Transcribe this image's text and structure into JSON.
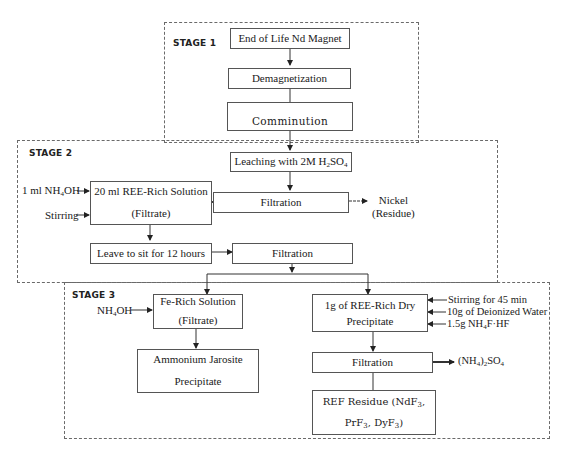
{
  "stages": [
    {
      "id": "stage1",
      "label": "STAGE 1"
    },
    {
      "id": "stage2",
      "label": "STAGE 2"
    },
    {
      "id": "stage3",
      "label": "STAGE 3"
    }
  ],
  "boxes": {
    "end_of_life": "End of Life Nd Magnet",
    "demagnetization": "Demagnetization",
    "comminution": "Comminution",
    "leaching_prefix": "Leaching with 2M H",
    "leaching_sub1": "2",
    "leaching_mid": "SO",
    "leaching_sub2": "4",
    "filtration1": "Filtration",
    "ree_solution_line1": "20 ml REE-Rich Solution",
    "ree_solution_line2": "(Filtrate)",
    "leave_to_sit": "Leave to sit for 12 hours",
    "filtration2": "Filtration",
    "fe_solution_line1": "Fe-Rich Solution",
    "fe_solution_line2": "(Filtrate)",
    "jarosite_line1": "Ammonium Jarosite",
    "jarosite_line2": "Precipitate",
    "ree_dry_line1": "1g of REE-Rich Dry",
    "ree_dry_line2": "Precipitate",
    "filtration3": "Filtration",
    "ref_residue_line1": "REF Residue (NdF",
    "ref_residue_line1_sub": "3",
    "ref_residue_line1_end": ",",
    "ref_residue_line2_a": "PrF",
    "ref_residue_line2_a_sub": "3",
    "ref_residue_line2_b": ", DyF",
    "ref_residue_line2_b_sub": "3",
    "ref_residue_line2_end": ")"
  },
  "inputs": {
    "nh4oh_1ml_prefix": "1 ml NH",
    "nh4oh_1ml_sub": "4",
    "nh4oh_1ml_suffix": "OH",
    "stirring": "Stirring",
    "nh4oh_prefix": "NH",
    "nh4oh_sub": "4",
    "nh4oh_suffix": "OH",
    "stirring_45": "Stirring for 45 min",
    "deionized_water": "10g of Deionized Water",
    "nh4f_prefix": "1.5g NH",
    "nh4f_sub": "4",
    "nh4f_suffix": "F·HF"
  },
  "outputs": {
    "nickel_line1": "Nickel",
    "nickel_line2": "(Residue)",
    "ammonium_sulfate_a": "(NH",
    "ammonium_sulfate_sub1": "4",
    "ammonium_sulfate_b": ")",
    "ammonium_sulfate_sub2": "2",
    "ammonium_sulfate_c": "SO",
    "ammonium_sulfate_sub3": "4"
  }
}
